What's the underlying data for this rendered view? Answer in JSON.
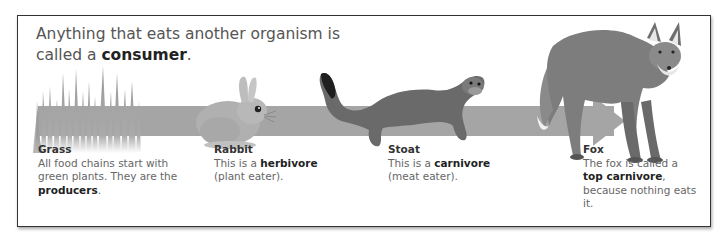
{
  "title": {
    "line1": "Anything that eats another organism is",
    "line2_prefix": "called a ",
    "line2_bold": "consumer",
    "line2_suffix": "."
  },
  "arrow": {
    "color": "#a5a5a5",
    "direction": "right"
  },
  "chain": [
    {
      "name": "Grass",
      "icon": "grass-icon",
      "text_parts": [
        "All food chains start with green plants. They are the ",
        "producers",
        "."
      ]
    },
    {
      "name": "Rabbit",
      "icon": "rabbit-icon",
      "text_parts": [
        "This is a ",
        "herbivore",
        " (plant eater)."
      ]
    },
    {
      "name": "Stoat",
      "icon": "stoat-icon",
      "text_parts": [
        "This is a ",
        "carnivore",
        " (meat eater)."
      ]
    },
    {
      "name": "Fox",
      "icon": "fox-icon",
      "text_parts": [
        "The fox is called a ",
        "top carnivore",
        ", because nothing eats it."
      ]
    }
  ]
}
